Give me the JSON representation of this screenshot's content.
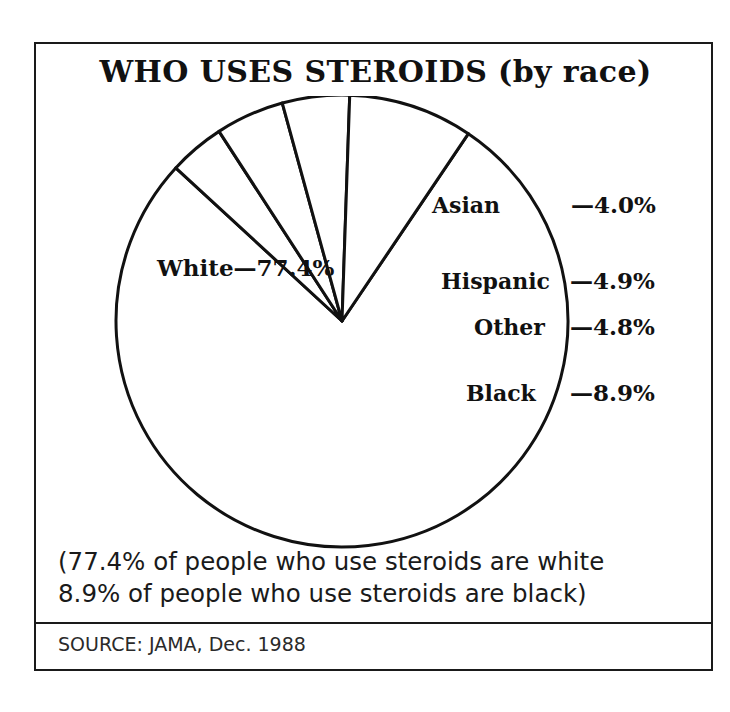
{
  "chart_data": {
    "type": "pie",
    "title": "WHO USES STEROIDS (by race)",
    "categories": [
      "White",
      "Asian",
      "Hispanic",
      "Other",
      "Black"
    ],
    "values": [
      77.4,
      4.0,
      4.9,
      4.8,
      8.9
    ],
    "value_suffix": "%",
    "labels": [
      {
        "name": "White",
        "value": 77.4,
        "text": "White—77.4%",
        "placement": "inside"
      },
      {
        "name": "Asian",
        "value": 4.0,
        "text": "Asian",
        "pct_text": "—4.0%",
        "placement": "inside-with-external-percent"
      },
      {
        "name": "Hispanic",
        "value": 4.9,
        "text": "Hispanic",
        "pct_text": "—4.9%",
        "placement": "inside-with-external-percent"
      },
      {
        "name": "Other",
        "value": 4.8,
        "text": "Other",
        "pct_text": "—4.8%",
        "placement": "inside-with-external-percent"
      },
      {
        "name": "Black",
        "value": 8.9,
        "text": "Black",
        "pct_text": "—8.9%",
        "placement": "inside-with-external-percent"
      }
    ],
    "legend": "none",
    "grid": false,
    "slice_fill": "#ffffff",
    "slice_stroke": "#111111",
    "start_angle_deg": -56,
    "direction": "clockwise"
  },
  "caption": {
    "line1": "(77.4% of people who use steroids are white",
    "line2": "8.9% of people who use steroids are black)"
  },
  "source": {
    "text": "SOURCE: JAMA, Dec. 1988"
  }
}
